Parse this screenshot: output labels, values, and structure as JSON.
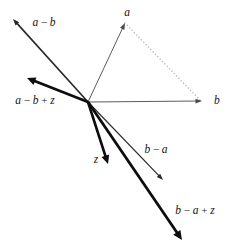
{
  "figure": {
    "background_color": "#ffffff",
    "ink_color": "#141414",
    "thin_color": "#3a3a3a",
    "dotted_color": "#b4b4b4",
    "origin": {
      "x": 88,
      "y": 102
    }
  },
  "chart_data": {
    "type": "diagram",
    "subtype": "vector-field",
    "origin": {
      "x": 88,
      "y": 102
    },
    "vectors": [
      {
        "id": "a",
        "label": "a",
        "style": "thin",
        "stroke_width": 0.9,
        "color": "#4a4a4a",
        "from": {
          "x": 88,
          "y": 102
        },
        "to": {
          "x": 125,
          "y": 23
        },
        "label_pos": {
          "x": 127,
          "y": 13
        },
        "label_anchor": "middle"
      },
      {
        "id": "b",
        "label": "b",
        "style": "thin",
        "stroke_width": 0.9,
        "color": "#4a4a4a",
        "from": {
          "x": 88,
          "y": 102
        },
        "to": {
          "x": 202,
          "y": 101
        },
        "label_pos": {
          "x": 214,
          "y": 101
        },
        "label_anchor": "start"
      },
      {
        "id": "a-minus-b",
        "label": "a − b",
        "style": "medium",
        "stroke_width": 1.6,
        "color": "#262626",
        "from": {
          "x": 88,
          "y": 102
        },
        "to": {
          "x": 13,
          "y": 19
        },
        "label_pos": {
          "x": 44,
          "y": 23
        },
        "label_anchor": "middle"
      },
      {
        "id": "a-minus-b-plus-z",
        "label": "a − b + z",
        "style": "thick",
        "stroke_width": 2.6,
        "color": "#0d0d0d",
        "from": {
          "x": 88,
          "y": 102
        },
        "to": {
          "x": 27,
          "y": 78
        },
        "label_pos": {
          "x": 35,
          "y": 101
        },
        "label_anchor": "middle"
      },
      {
        "id": "b-minus-a",
        "label": "b − a",
        "style": "thin",
        "stroke_width": 1.2,
        "color": "#2b2b2b",
        "from": {
          "x": 88,
          "y": 102
        },
        "to": {
          "x": 163,
          "y": 180
        },
        "label_pos": {
          "x": 156,
          "y": 150
        },
        "label_anchor": "middle"
      },
      {
        "id": "b-minus-a-plus-z",
        "label": "b − a + z",
        "style": "thick",
        "stroke_width": 2.8,
        "color": "#0d0d0d",
        "from": {
          "x": 88,
          "y": 102
        },
        "to": {
          "x": 182,
          "y": 240
        },
        "label_pos": {
          "x": 195,
          "y": 211
        },
        "label_anchor": "middle"
      },
      {
        "id": "z",
        "label": "z",
        "style": "thick",
        "stroke_width": 2.6,
        "color": "#0d0d0d",
        "from": {
          "x": 88,
          "y": 102
        },
        "to": {
          "x": 108,
          "y": 164
        },
        "label_pos": {
          "x": 96,
          "y": 160
        },
        "label_anchor": "middle"
      }
    ],
    "connectors": [
      {
        "id": "a-to-b-dotted",
        "style": "dotted",
        "color": "#bdbdbd",
        "from": {
          "x": 125,
          "y": 23
        },
        "to": {
          "x": 200,
          "y": 100
        }
      }
    ],
    "labels": [
      "a",
      "b",
      "a − b",
      "a − b + z",
      "b − a",
      "b − a + z",
      "z"
    ]
  }
}
